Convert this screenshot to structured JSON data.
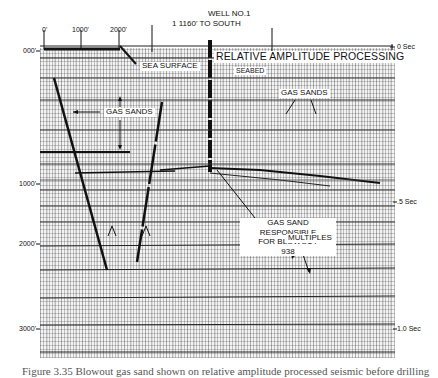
{
  "header": {
    "well_label": "WELL NO.1",
    "well_offset": "1 1160' TO SOUTH"
  },
  "scale_bar": {
    "ticks": [
      "0'",
      "1000'",
      "2000'"
    ]
  },
  "title": "RELATIVE AMPLITUDE PROCESSING",
  "annotations": {
    "sea_surface": "SEA SURFACE",
    "seabed": "SEABED",
    "gas_sands_left": "GAS SANDS",
    "gas_sands_right": "GAS SANDS",
    "blowout_line1": "GAS SAND RESPONSIBLE",
    "blowout_line2": "FOR BLOWOUT",
    "blowout_line3": "938",
    "multiples": "MULTIPLES"
  },
  "depth_axis": {
    "labels": [
      "000'",
      "1000'",
      "2000'",
      "3000'"
    ]
  },
  "time_axis": {
    "labels": [
      "0 Sec",
      ".5 Sec",
      "1.0 Sec"
    ]
  },
  "caption": "Figure 3.35 Blowout gas sand shown on relative amplitude processed seismic before drilling"
}
